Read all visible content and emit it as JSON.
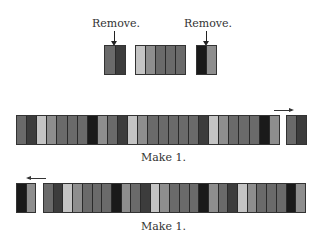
{
  "colors": {
    "black": "#1a1a1a",
    "dark": "#3c3c3c",
    "mid": "#6a6a6a",
    "midlight": "#8e8e8e",
    "light": "#c4c4c4"
  },
  "top_section": {
    "remove_left_label": "Remove.",
    "remove_right_label": "Remove.",
    "left_block": [
      "mid",
      "dark"
    ],
    "middle_block": [
      "light",
      "midlight",
      "mid",
      "mid",
      "mid"
    ],
    "right_block": [
      "black",
      "midlight"
    ]
  },
  "row1": {
    "main_strip": [
      "mid",
      "dark",
      "light",
      "midlight",
      "mid",
      "mid",
      "mid",
      "black",
      "midlight",
      "mid",
      "dark",
      "light",
      "midlight",
      "mid",
      "mid",
      "mid",
      "mid",
      "mid",
      "dark",
      "light",
      "midlight",
      "mid",
      "mid",
      "mid",
      "black",
      "midlight"
    ],
    "detached_block": [
      "mid",
      "dark"
    ],
    "arrow_direction": "right",
    "caption": "Make 1."
  },
  "row2": {
    "detached_block": [
      "black",
      "midlight"
    ],
    "main_strip": [
      "mid",
      "dark",
      "light",
      "midlight",
      "mid",
      "mid",
      "mid",
      "black",
      "midlight",
      "mid",
      "dark",
      "light",
      "midlight",
      "mid",
      "mid",
      "mid",
      "black",
      "midlight",
      "mid",
      "dark",
      "light",
      "midlight",
      "mid",
      "mid",
      "mid",
      "black",
      "midlight"
    ],
    "arrow_direction": "left",
    "caption": "Make 1."
  }
}
